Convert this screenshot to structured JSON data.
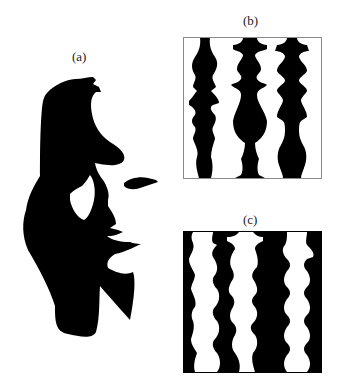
{
  "figure": {
    "panels": [
      {
        "id": "a",
        "label": "(a)",
        "description": "face profile silhouette with saxophone player figure"
      },
      {
        "id": "b",
        "label": "(b)",
        "description": "three black vertical columns on white ground"
      },
      {
        "id": "c",
        "label": "(c)",
        "description": "three white vertical columns on black ground"
      }
    ],
    "colors": {
      "ink": "#000000",
      "paper": "#ffffff",
      "frame": "#888888"
    }
  }
}
